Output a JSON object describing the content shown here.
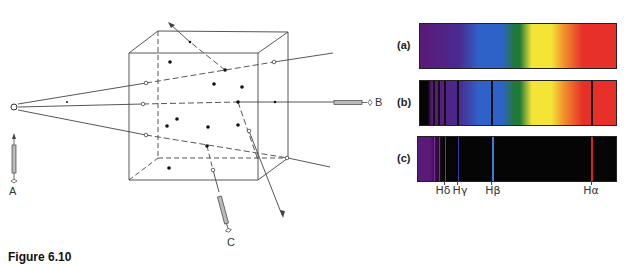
{
  "figure": {
    "caption": "Figure 6.10",
    "observers": {
      "a": "A",
      "b": "B",
      "c": "C"
    },
    "spectra": {
      "a": {
        "label": "(a)",
        "kind": "continuous"
      },
      "b": {
        "label": "(b)",
        "kind": "absorption"
      },
      "c": {
        "label": "(c)",
        "kind": "emission"
      }
    },
    "lines": [
      {
        "name": "Hδ",
        "x": 444,
        "color": "#7a2aa0"
      },
      {
        "name": "Hγ",
        "x": 457,
        "color": "#3a3ab0"
      },
      {
        "name": "Hβ",
        "x": 491,
        "color": "#3a7ad8"
      },
      {
        "name": "Hα",
        "x": 591,
        "color": "#e02020"
      }
    ],
    "colors": {
      "violet": "#5a1a78",
      "blue": "#2f62c8",
      "green": "#1f7a3a",
      "yellow": "#f4e436",
      "orange": "#f08a2a",
      "red": "#e8302a",
      "black": "#050505"
    }
  }
}
